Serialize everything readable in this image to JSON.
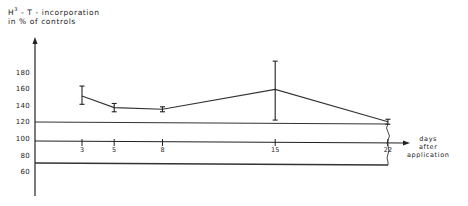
{
  "chart_data": {
    "type": "line",
    "title": "",
    "ylabel": "H3 - T - incorporation in % of controls",
    "ylabel_line1_prefix": "H",
    "ylabel_line1_sup": "3",
    "ylabel_line1_rest": " - T - incorporation",
    "ylabel_line2": "in % of controls",
    "xlabel": "days after application",
    "xlabel_lines": [
      "days",
      "after",
      "application"
    ],
    "yticks": [
      "180",
      "160",
      "140",
      "120",
      "100",
      "80",
      "60"
    ],
    "xticks": [
      "3",
      "5",
      "8",
      "15",
      "22"
    ],
    "ylim": [
      50,
      200
    ],
    "xlim": [
      0,
      24
    ],
    "grid": false,
    "reference_lines": [
      120,
      100,
      80
    ],
    "series": [
      {
        "name": "H3-T incorporation",
        "x": [
          3,
          5,
          8,
          15,
          22
        ],
        "values": [
          153,
          139,
          137,
          161,
          122
        ],
        "error_low": [
          143,
          134,
          134,
          124,
          119
        ],
        "error_high": [
          165,
          144,
          140,
          195,
          125
        ]
      }
    ],
    "annotations": [
      "axis break at day 22"
    ],
    "legend": null
  }
}
